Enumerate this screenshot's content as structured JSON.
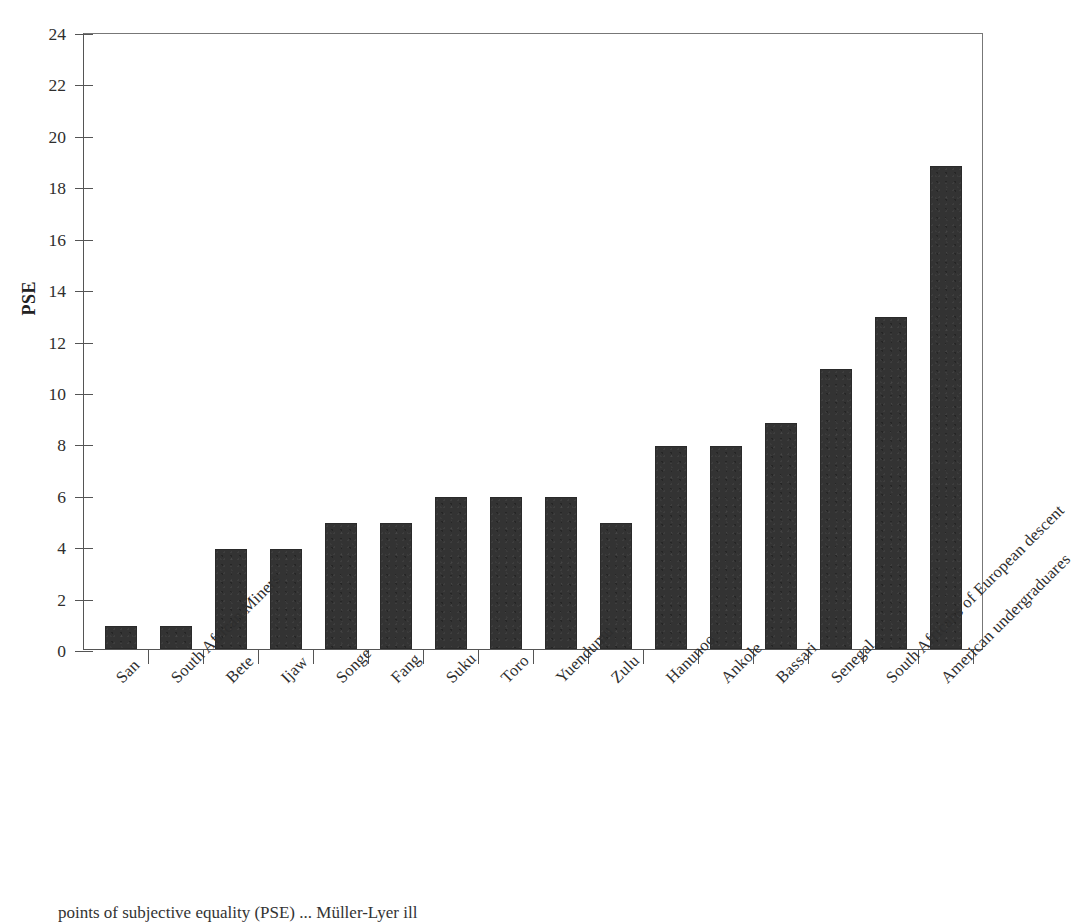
{
  "chart_data": {
    "type": "bar",
    "title": "",
    "xlabel": "",
    "ylabel": "PSE",
    "ylim": [
      0,
      24
    ],
    "yticks": [
      0,
      2,
      4,
      6,
      8,
      10,
      12,
      14,
      16,
      18,
      20,
      22,
      24
    ],
    "grid": false,
    "legend": null,
    "bar_color": "#333333",
    "categories": [
      "San",
      "South African Miners",
      "Bete",
      "Ijaw",
      "Songe",
      "Fang",
      "Suku",
      "Toro",
      "Yuendumu",
      "Zulu",
      "Hanunoo",
      "Ankole",
      "Bassari",
      "Senegal",
      "South Africans of European descent",
      "American undergraduares"
    ],
    "values": [
      0.9,
      0.9,
      3.9,
      3.9,
      4.9,
      4.9,
      5.9,
      5.9,
      5.9,
      4.9,
      7.9,
      7.9,
      8.8,
      10.9,
      12.9,
      18.8
    ]
  },
  "axes": {
    "y_label": "PSE",
    "y_tick_labels": [
      "0",
      "2",
      "4",
      "6",
      "8",
      "10",
      "12",
      "14",
      "16",
      "18",
      "20",
      "22",
      "24"
    ]
  },
  "caption": {
    "line": "points of subjective equality (PSE) ... Müller-Lyer ill"
  }
}
